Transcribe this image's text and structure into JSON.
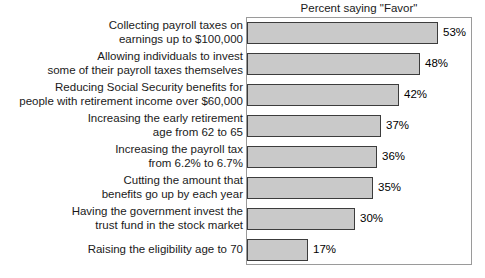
{
  "chart_data": {
    "type": "bar",
    "orientation": "horizontal",
    "title": "Percent saying \"Favor\"",
    "xlabel": "",
    "ylabel": "",
    "xlim": [
      0,
      62
    ],
    "grid": false,
    "legend": false,
    "value_suffix": "%",
    "categories": [
      "Collecting payroll taxes on earnings up to $100,000",
      "Allowing individuals to invest some of their payroll taxes themselves",
      "Reducing Social Security benefits for people with retirement income over $60,000",
      "Increasing the early retirement age from 62 to 65",
      "Increasing the payroll tax from 6.2% to 6.7%",
      "Cutting the amount that benefits go up by each year",
      "Having the government invest the trust fund in the stock market",
      "Raising the eligibility age to 70"
    ],
    "category_lines": [
      [
        "Collecting payroll taxes on",
        "earnings up to $100,000"
      ],
      [
        "Allowing individuals to invest",
        "some of their payroll taxes themselves"
      ],
      [
        "Reducing Social Security benefits for",
        "people with retirement income over $60,000"
      ],
      [
        "Increasing the early retirement",
        "age from 62 to 65"
      ],
      [
        "Increasing the payroll tax",
        "from 6.2% to 6.7%"
      ],
      [
        "Cutting the amount that",
        "benefits go up by each year"
      ],
      [
        "Having the government invest the",
        "trust fund in the stock market"
      ],
      [
        "Raising the eligibility age to 70"
      ]
    ],
    "values": [
      53,
      48,
      42,
      37,
      36,
      35,
      30,
      17
    ],
    "value_labels": [
      "53%",
      "48%",
      "42%",
      "37%",
      "36%",
      "35%",
      "30%",
      "17%"
    ],
    "colors": {
      "bar_fill": "#c9c9c9",
      "bar_border": "#3c3c3c",
      "plot_border": "#9a9a9a",
      "text": "#1a1a1a",
      "background": "#ffffff"
    }
  }
}
